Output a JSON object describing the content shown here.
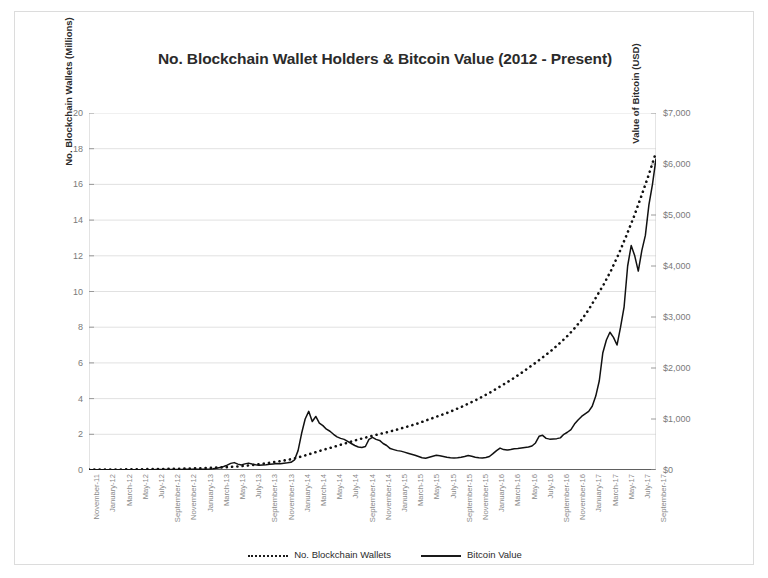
{
  "chart_data": {
    "type": "line",
    "title": "No. Blockchain Wallet Holders & Bitcoin Value (2012 - Present)",
    "xlabel": "",
    "ylabel": "No. Blockchain Wallets (Millions)",
    "y2label": "Value of Bitcoin (USD)",
    "ylim": [
      0,
      20
    ],
    "y2lim": [
      0,
      7000
    ],
    "y_ticks": [
      "0",
      "2",
      "4",
      "6",
      "8",
      "10",
      "12",
      "14",
      "16",
      "18",
      "20"
    ],
    "y_tick_values": [
      0,
      2,
      4,
      6,
      8,
      10,
      12,
      14,
      16,
      18,
      20
    ],
    "y2_ticks": [
      "$0",
      "$1,000",
      "$2,000",
      "$3,000",
      "$4,000",
      "$5,000",
      "$6,000",
      "$7,000"
    ],
    "y2_tick_values": [
      0,
      1000,
      2000,
      3000,
      4000,
      5000,
      6000,
      7000
    ],
    "grid": true,
    "legend_position": "bottom",
    "categories": [
      "November-11",
      "January-12",
      "March-12",
      "May-12",
      "July-12",
      "September-12",
      "November-12",
      "January-13",
      "March-13",
      "May-13",
      "July-13",
      "September-13",
      "November-13",
      "January-14",
      "March-14",
      "May-14",
      "July-14",
      "September-14",
      "November-14",
      "January-15",
      "March-15",
      "May-15",
      "July-15",
      "September-15",
      "November-15",
      "January-16",
      "March-16",
      "May-16",
      "July-16",
      "September-16",
      "November-16",
      "January-17",
      "March-17",
      "May-17",
      "July-17",
      "September-17"
    ],
    "series": [
      {
        "name": "No. Blockchain Wallets",
        "style": "dotted",
        "axis": "left",
        "unit": "millions",
        "x": [
          "November-11",
          "January-12",
          "March-12",
          "May-12",
          "July-12",
          "September-12",
          "November-12",
          "January-13",
          "March-13",
          "May-13",
          "July-13",
          "September-13",
          "November-13",
          "January-14",
          "March-14",
          "May-14",
          "July-14",
          "September-14",
          "November-14",
          "January-15",
          "March-15",
          "May-15",
          "July-15",
          "September-15",
          "November-15",
          "January-16",
          "March-16",
          "May-16",
          "July-16",
          "September-16",
          "November-16",
          "January-17",
          "March-17",
          "May-17",
          "July-17",
          "September-17"
        ],
        "values": [
          0.02,
          0.03,
          0.04,
          0.05,
          0.06,
          0.08,
          0.1,
          0.14,
          0.2,
          0.32,
          0.48,
          0.62,
          0.9,
          1.2,
          1.45,
          1.7,
          1.92,
          2.12,
          2.35,
          2.6,
          2.9,
          3.2,
          3.55,
          3.95,
          4.4,
          4.9,
          5.45,
          6.05,
          6.7,
          7.45,
          8.4,
          9.7,
          11.2,
          13.1,
          15.3,
          17.8
        ]
      },
      {
        "name": "Bitcoin Value",
        "style": "solid",
        "axis": "right",
        "unit": "USD",
        "x": [
          "November-11",
          "January-12",
          "March-12",
          "May-12",
          "July-12",
          "September-12",
          "November-12",
          "January-13",
          "March-13",
          "May-13",
          "July-13",
          "September-13",
          "November-13",
          "January-14",
          "March-14",
          "May-14",
          "July-14",
          "September-14",
          "November-14",
          "January-15",
          "March-15",
          "May-15",
          "July-15",
          "September-15",
          "November-15",
          "January-16",
          "March-16",
          "May-16",
          "July-16",
          "September-16",
          "November-16",
          "January-17",
          "March-17",
          "May-17",
          "July-17",
          "September-17"
        ],
        "values": [
          3,
          6,
          5,
          5,
          8,
          12,
          12,
          18,
          90,
          120,
          90,
          130,
          1150,
          850,
          620,
          450,
          600,
          400,
          380,
          230,
          250,
          235,
          285,
          235,
          380,
          400,
          420,
          450,
          660,
          610,
          740,
          980,
          1100,
          2300,
          2700,
          6100
        ],
        "annotations": [
          {
            "label": "2013 bubble peak",
            "x": "November-13",
            "y": 1150
          },
          {
            "label": "bear market low",
            "x": "January-15",
            "y": 230
          },
          {
            "label": "2017 rally high",
            "x": "September-17",
            "y": 6100
          }
        ]
      }
    ],
    "bitcoin_detail": [
      3,
      3,
      4,
      5,
      6,
      7,
      6,
      5,
      5,
      5,
      5,
      5,
      5,
      5,
      5,
      5,
      5,
      6,
      7,
      9,
      11,
      12,
      12,
      11,
      11,
      12,
      12,
      13,
      13,
      13,
      13,
      14,
      15,
      17,
      20,
      26,
      34,
      47,
      68,
      95,
      130,
      145,
      115,
      100,
      120,
      135,
      118,
      105,
      95,
      100,
      105,
      112,
      120,
      128,
      125,
      132,
      140,
      150,
      200,
      380,
      720,
      1000,
      1150,
      950,
      1050,
      920,
      870,
      800,
      760,
      700,
      650,
      620,
      600,
      560,
      520,
      480,
      450,
      440,
      460,
      600,
      640,
      600,
      580,
      520,
      480,
      420,
      400,
      380,
      370,
      350,
      330,
      310,
      290,
      265,
      240,
      230,
      250,
      270,
      290,
      280,
      265,
      250,
      240,
      235,
      240,
      250,
      265,
      285,
      270,
      250,
      240,
      235,
      245,
      265,
      320,
      380,
      430,
      400,
      390,
      400,
      415,
      420,
      430,
      440,
      450,
      470,
      530,
      660,
      680,
      620,
      605,
      610,
      615,
      630,
      700,
      740,
      790,
      900,
      980,
      1050,
      1100,
      1150,
      1250,
      1450,
      1750,
      2300,
      2550,
      2700,
      2600,
      2450,
      2800,
      3200,
      4000,
      4400,
      4200,
      3900,
      4300,
      4600,
      5200,
      5600,
      6100
    ],
    "wallets_detail": [
      0.02,
      0.022,
      0.025,
      0.028,
      0.031,
      0.035,
      0.039,
      0.043,
      0.048,
      0.053,
      0.059,
      0.065,
      0.072,
      0.08,
      0.09,
      0.1,
      0.115,
      0.13,
      0.15,
      0.175,
      0.2,
      0.24,
      0.28,
      0.33,
      0.39,
      0.45,
      0.52,
      0.6,
      0.7,
      0.82,
      0.95,
      1.08,
      1.2,
      1.32,
      1.45,
      1.57,
      1.7,
      1.81,
      1.92,
      2.02,
      2.12,
      2.23,
      2.35,
      2.47,
      2.6,
      2.75,
      2.9,
      3.05,
      3.2,
      3.37,
      3.55,
      3.75,
      3.95,
      4.17,
      4.4,
      4.65,
      4.9,
      5.17,
      5.45,
      5.75,
      6.05,
      6.37,
      6.7,
      7.07,
      7.45,
      7.9,
      8.4,
      9.0,
      9.7,
      10.4,
      11.2,
      12.1,
      13.1,
      14.15,
      15.3,
      16.5,
      17.8
    ]
  },
  "legend": {
    "entries": [
      {
        "label": "No. Blockchain Wallets",
        "style": "dotted"
      },
      {
        "label": "Bitcoin Value",
        "style": "solid"
      }
    ]
  }
}
